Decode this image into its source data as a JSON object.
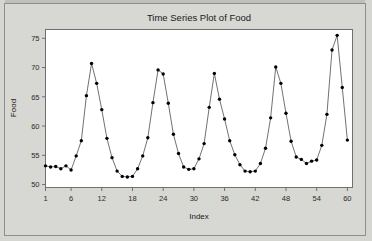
{
  "window": {
    "background_color": "#d5d5d1",
    "border_color": "#8e8e8a"
  },
  "chart_data": {
    "type": "line",
    "title": "Time Series Plot of Food",
    "xlabel": "Index",
    "ylabel": "Food",
    "grid": false,
    "legend": null,
    "marker": "filled-circle",
    "line_color": "#4d4d4d",
    "marker_color": "#000000",
    "xlim": [
      1,
      61
    ],
    "ylim": [
      49.5,
      76.5
    ],
    "xticks": [
      1,
      6,
      12,
      18,
      24,
      30,
      36,
      42,
      48,
      54,
      60
    ],
    "yticks": [
      50,
      55,
      60,
      65,
      70,
      75
    ],
    "xtick_labels": [
      "1",
      "6",
      "12",
      "18",
      "24",
      "30",
      "36",
      "42",
      "48",
      "54",
      "60"
    ],
    "ytick_labels": [
      "50",
      "55",
      "60",
      "65",
      "70",
      "75"
    ],
    "x": [
      1,
      2,
      3,
      4,
      5,
      6,
      7,
      8,
      9,
      10,
      11,
      12,
      13,
      14,
      15,
      16,
      17,
      18,
      19,
      20,
      21,
      22,
      23,
      24,
      25,
      26,
      27,
      28,
      29,
      30,
      31,
      32,
      33,
      34,
      35,
      36,
      37,
      38,
      39,
      40,
      41,
      42,
      43,
      44,
      45,
      46,
      47,
      48,
      49,
      50,
      51,
      52,
      53,
      54,
      55,
      56,
      57,
      58,
      59,
      60
    ],
    "values": [
      53.2,
      53.0,
      53.1,
      52.7,
      53.2,
      52.5,
      54.9,
      57.5,
      65.2,
      70.7,
      67.3,
      62.8,
      57.9,
      54.6,
      52.3,
      51.4,
      51.3,
      51.4,
      52.7,
      54.9,
      58.0,
      64.0,
      69.6,
      68.9,
      63.9,
      58.6,
      55.3,
      53.0,
      52.6,
      52.7,
      54.4,
      57.0,
      63.2,
      69.0,
      64.6,
      61.2,
      57.5,
      55.1,
      53.4,
      52.3,
      52.2,
      52.3,
      53.6,
      56.2,
      61.4,
      70.1,
      67.3,
      62.2,
      57.4,
      54.7,
      54.3,
      53.6,
      54.0,
      54.2,
      56.7,
      62.0,
      73.0,
      75.5,
      66.6,
      57.6
    ],
    "series": [
      {
        "name": "Food",
        "values": [
          53.2,
          53.0,
          53.1,
          52.7,
          53.2,
          52.5,
          54.9,
          57.5,
          65.2,
          70.7,
          67.3,
          62.8,
          57.9,
          54.6,
          52.3,
          51.4,
          51.3,
          51.4,
          52.7,
          54.9,
          58.0,
          64.0,
          69.6,
          68.9,
          63.9,
          58.6,
          55.3,
          53.0,
          52.6,
          52.7,
          54.4,
          57.0,
          63.2,
          69.0,
          64.6,
          61.2,
          57.5,
          55.1,
          53.4,
          52.3,
          52.2,
          52.3,
          53.6,
          56.2,
          61.4,
          70.1,
          67.3,
          62.2,
          57.4,
          54.7,
          54.3,
          53.6,
          54.0,
          54.2,
          56.7,
          62.0,
          73.0,
          75.5,
          66.6,
          57.6
        ]
      }
    ]
  }
}
